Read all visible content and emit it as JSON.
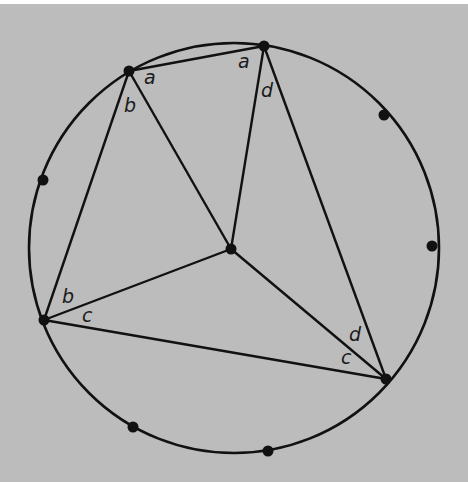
{
  "diagram": {
    "type": "inscribed-angle-construction",
    "background_color": "#bcbcbc",
    "stroke_color": "#111111",
    "circle": {
      "cx": 234,
      "cy": 248,
      "r": 205
    },
    "center_point": {
      "id": "O",
      "x": 231,
      "y": 249
    },
    "vertices": [
      {
        "id": "P1",
        "x": 129,
        "y": 71
      },
      {
        "id": "P2",
        "x": 264,
        "y": 46
      },
      {
        "id": "P3",
        "x": 44,
        "y": 320
      },
      {
        "id": "P4",
        "x": 386,
        "y": 379
      }
    ],
    "extra_points": [
      {
        "id": "E1",
        "x": 43,
        "y": 180
      },
      {
        "id": "E2",
        "x": 384,
        "y": 115
      },
      {
        "id": "E3",
        "x": 432,
        "y": 246
      },
      {
        "id": "E4",
        "x": 133,
        "y": 427
      },
      {
        "id": "E5",
        "x": 268,
        "y": 451
      }
    ],
    "segments": [
      {
        "from": "P1",
        "to": "P2"
      },
      {
        "from": "P1",
        "to": "P3"
      },
      {
        "from": "P1",
        "to": "O"
      },
      {
        "from": "P2",
        "to": "O"
      },
      {
        "from": "P2",
        "to": "P4"
      },
      {
        "from": "P3",
        "to": "O"
      },
      {
        "from": "P3",
        "to": "P4"
      },
      {
        "from": "O",
        "to": "P4"
      }
    ],
    "labels": [
      {
        "text": "a",
        "x": 144,
        "y": 84
      },
      {
        "text": "a",
        "x": 238,
        "y": 68
      },
      {
        "text": "b",
        "x": 124,
        "y": 112
      },
      {
        "text": "d",
        "x": 261,
        "y": 97
      },
      {
        "text": "b",
        "x": 62,
        "y": 303
      },
      {
        "text": "c",
        "x": 82,
        "y": 322
      },
      {
        "text": "d",
        "x": 349,
        "y": 341
      },
      {
        "text": "c",
        "x": 341,
        "y": 364
      }
    ]
  }
}
